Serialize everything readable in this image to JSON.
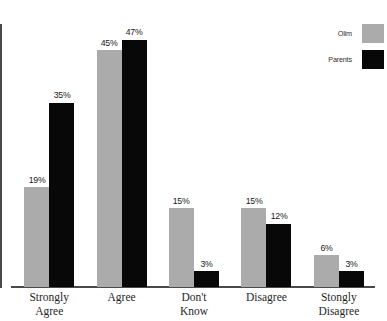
{
  "chart_data": {
    "type": "bar",
    "title": "",
    "subtitle": "",
    "xlabel": "",
    "ylabel": "",
    "ylim": [
      0,
      50
    ],
    "grid": false,
    "legend_position": "top-right",
    "value_suffix": "%",
    "categories": [
      "Strongly\nAgree",
      "Agree",
      "Don't\nKnow",
      "Disagree",
      "Stongly\nDisagree"
    ],
    "category_lines": [
      [
        "Strongly",
        "Agree"
      ],
      [
        "Agree",
        ""
      ],
      [
        "Don't",
        "Know"
      ],
      [
        "Disagree",
        ""
      ],
      [
        "Stongly",
        "Disagree"
      ]
    ],
    "series": [
      {
        "name": "Olim",
        "color": "#ababab",
        "values": [
          19,
          45,
          15,
          15,
          6
        ],
        "labels": [
          "19%",
          "45%",
          "15%",
          "15%",
          "6%"
        ]
      },
      {
        "name": "Parents",
        "color": "#080808",
        "values": [
          35,
          47,
          3,
          12,
          3
        ],
        "labels": [
          "35%",
          "47%",
          "3%",
          "12%",
          "3%"
        ]
      }
    ]
  },
  "legend": {
    "entries": [
      {
        "label": "Olim",
        "color": "#ababab"
      },
      {
        "label": "Parents",
        "color": "#080808"
      }
    ]
  },
  "axes": {
    "axis_color": "#4a4a4a"
  }
}
